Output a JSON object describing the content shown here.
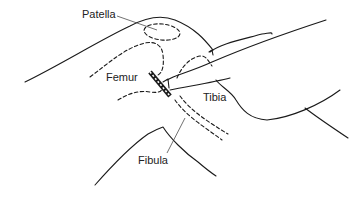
{
  "diagram": {
    "labels": [
      {
        "id": "patella",
        "text": "Patella",
        "x": 82,
        "y": 18
      },
      {
        "id": "femur",
        "text": "Femur",
        "x": 106,
        "y": 81
      },
      {
        "id": "tibia",
        "text": "Tibia",
        "x": 203,
        "y": 101
      },
      {
        "id": "fibula",
        "text": "Fibula",
        "x": 138,
        "y": 164
      }
    ],
    "colors": {
      "background": "#ffffff",
      "ink": "#1a1a1a",
      "label": "#222222"
    }
  }
}
